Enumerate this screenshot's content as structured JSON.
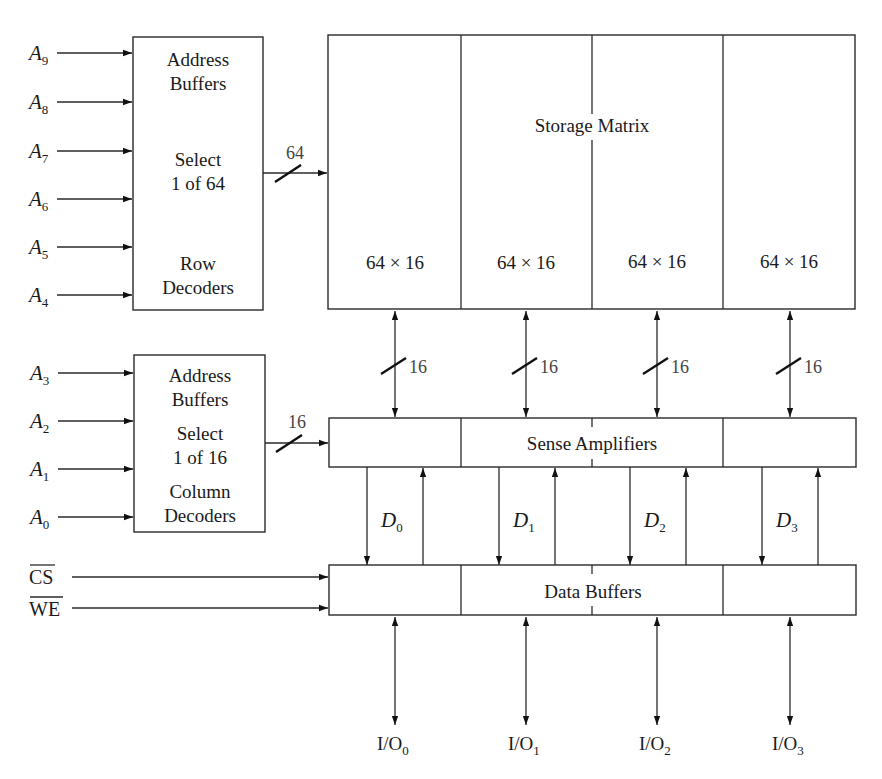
{
  "figure": {
    "row_decoder": {
      "lines": [
        "Address",
        "Buffers",
        "Select",
        "1 of 64",
        "Row",
        "Decoders"
      ],
      "inputs": [
        {
          "base": "A",
          "sub": "9"
        },
        {
          "base": "A",
          "sub": "8"
        },
        {
          "base": "A",
          "sub": "7"
        },
        {
          "base": "A",
          "sub": "6"
        },
        {
          "base": "A",
          "sub": "5"
        },
        {
          "base": "A",
          "sub": "4"
        }
      ],
      "bus_width": "64"
    },
    "column_decoder": {
      "lines": [
        "Address",
        "Buffers",
        "Select",
        "1 of 16",
        "Column",
        "Decoders"
      ],
      "inputs": [
        {
          "base": "A",
          "sub": "3"
        },
        {
          "base": "A",
          "sub": "2"
        },
        {
          "base": "A",
          "sub": "1"
        },
        {
          "base": "A",
          "sub": "0"
        }
      ],
      "bus_width": "16"
    },
    "storage_matrix": {
      "title": "Storage Matrix",
      "blocks": [
        "64 × 16",
        "64 × 16",
        "64 × 16",
        "64 × 16"
      ]
    },
    "matrix_to_sense_bus": [
      "16",
      "16",
      "16",
      "16"
    ],
    "sense_amplifiers": {
      "label": "Sense Amplifiers"
    },
    "data_lines": [
      {
        "base": "D",
        "sub": "0"
      },
      {
        "base": "D",
        "sub": "1"
      },
      {
        "base": "D",
        "sub": "2"
      },
      {
        "base": "D",
        "sub": "3"
      }
    ],
    "data_buffers": {
      "label": "Data Buffers"
    },
    "control_inputs": [
      {
        "label": "CS",
        "active_low": true
      },
      {
        "label": "WE",
        "active_low": true
      }
    ],
    "io_pins": [
      {
        "base": "I/O",
        "sub": "0"
      },
      {
        "base": "I/O",
        "sub": "1"
      },
      {
        "base": "I/O",
        "sub": "2"
      },
      {
        "base": "I/O",
        "sub": "3"
      }
    ]
  }
}
